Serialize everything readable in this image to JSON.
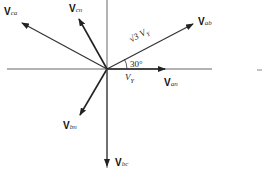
{
  "diagram": {
    "type": "phasor-diagram",
    "title": "",
    "origin": [
      107,
      69
    ],
    "vectors": [
      {
        "id": "ab",
        "bold": "V",
        "sub": "ab",
        "angle_deg": 30,
        "kind": "line-to-line"
      },
      {
        "id": "an",
        "bold": "V",
        "sub": "an",
        "angle_deg": 0,
        "kind": "phase"
      },
      {
        "id": "bn",
        "bold": "V",
        "sub": "bn",
        "angle_deg": -120,
        "kind": "phase"
      },
      {
        "id": "bc",
        "bold": "V",
        "sub": "bc",
        "angle_deg": -90,
        "kind": "line-to-line"
      },
      {
        "id": "cn",
        "bold": "V",
        "sub": "cn",
        "angle_deg": 120,
        "kind": "phase"
      },
      {
        "id": "ca",
        "bold": "V",
        "sub": "ca",
        "angle_deg": 150,
        "kind": "line-to-line"
      }
    ],
    "annotations": {
      "line_magnitude": "√3 V",
      "line_magnitude_sub": "Y",
      "phase_magnitude": "V",
      "phase_magnitude_sub": "Y",
      "angle": "30°"
    },
    "colors": {
      "axis": "#555555",
      "vector": "#222222",
      "text": "#111111"
    }
  }
}
